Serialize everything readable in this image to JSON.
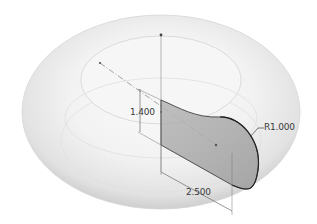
{
  "diagram": {
    "dimensions": {
      "height": "1.400",
      "length": "2.500",
      "radius": "R1.000"
    },
    "colors": {
      "background": "#ffffff",
      "torus_shade": "#e9e9e9",
      "profile_fill": "#a7a7a7",
      "line": "#444444",
      "construction": "#9a9a9a"
    }
  }
}
